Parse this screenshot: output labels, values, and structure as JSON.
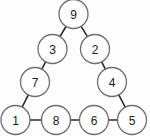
{
  "figure": {
    "background_color": "#fdfdfd",
    "node_fill_color": "#ffffff",
    "node_stroke_color": "#6e6e6e",
    "edge_color": "#2b2b2b",
    "label_color": "#1a1a1a",
    "node_radius": 14.5
  },
  "nodes": [
    {
      "id": "n9",
      "label": "9",
      "cx": 73.5,
      "cy": 14
    },
    {
      "id": "n3",
      "label": "3",
      "cx": 52.5,
      "cy": 49
    },
    {
      "id": "n2",
      "label": "2",
      "cx": 95,
      "cy": 49
    },
    {
      "id": "n7",
      "label": "7",
      "cx": 35,
      "cy": 82
    },
    {
      "id": "n4",
      "label": "4",
      "cx": 112,
      "cy": 82
    },
    {
      "id": "n1",
      "label": "1",
      "cx": 15.5,
      "cy": 120
    },
    {
      "id": "n8",
      "label": "8",
      "cx": 56,
      "cy": 120
    },
    {
      "id": "n6",
      "label": "6",
      "cx": 94,
      "cy": 120
    },
    {
      "id": "n5",
      "label": "5",
      "cx": 132,
      "cy": 120
    }
  ],
  "edges": [
    {
      "from": "n9",
      "to": "n3"
    },
    {
      "from": "n9",
      "to": "n2"
    },
    {
      "from": "n3",
      "to": "n7"
    },
    {
      "from": "n2",
      "to": "n4"
    },
    {
      "from": "n7",
      "to": "n1"
    },
    {
      "from": "n4",
      "to": "n5"
    },
    {
      "from": "n1",
      "to": "n8"
    },
    {
      "from": "n8",
      "to": "n6"
    },
    {
      "from": "n6",
      "to": "n5"
    }
  ]
}
